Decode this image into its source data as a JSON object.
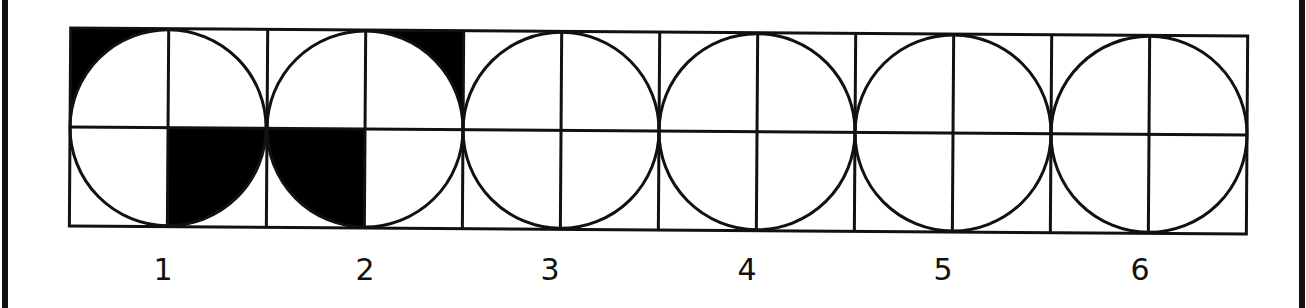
{
  "figure": {
    "title": "",
    "colors": {
      "ink": "#111111",
      "fill": "#000000",
      "background": "#ffffff"
    },
    "panels": [
      {
        "label": "1",
        "shaded": [
          {
            "quadrant": "top-left",
            "region": "outer-corner"
          },
          {
            "quadrant": "bottom-right",
            "region": "full-cell"
          }
        ]
      },
      {
        "label": "2",
        "shaded": [
          {
            "quadrant": "top-right",
            "region": "outer-corner"
          },
          {
            "quadrant": "bottom-left",
            "region": "inner-circle"
          }
        ]
      },
      {
        "label": "3",
        "shaded": []
      },
      {
        "label": "4",
        "shaded": []
      },
      {
        "label": "5",
        "shaded": []
      },
      {
        "label": "6",
        "shaded": []
      }
    ]
  }
}
